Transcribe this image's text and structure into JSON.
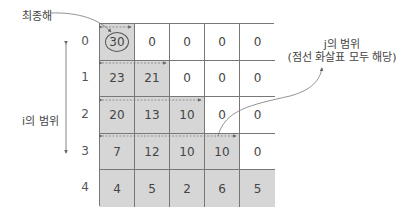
{
  "labels": {
    "final_solution": "최종해",
    "i_range": "i의 범위",
    "j_range_line1": "j의 범위",
    "j_range_line2": "(점선 화살표 모두 해당)"
  },
  "row_indices": [
    "0",
    "1",
    "2",
    "3",
    "4"
  ],
  "table": {
    "rows": [
      [
        "30",
        "0",
        "0",
        "0",
        "0"
      ],
      [
        "23",
        "21",
        "0",
        "0",
        "0"
      ],
      [
        "20",
        "13",
        "10",
        "0",
        "0"
      ],
      [
        "7",
        "12",
        "10",
        "10",
        "0"
      ],
      [
        "4",
        "5",
        "2",
        "6",
        "5"
      ]
    ],
    "shaded": [
      [
        true,
        false,
        false,
        false,
        false
      ],
      [
        true,
        true,
        false,
        false,
        false
      ],
      [
        true,
        true,
        true,
        false,
        false
      ],
      [
        true,
        true,
        true,
        true,
        false
      ],
      [
        true,
        true,
        true,
        true,
        true
      ]
    ],
    "circled_cell": [
      0,
      0
    ]
  },
  "colors": {
    "shaded": "#d6d6d6",
    "grid_line": "#777777",
    "text": "#444444"
  }
}
